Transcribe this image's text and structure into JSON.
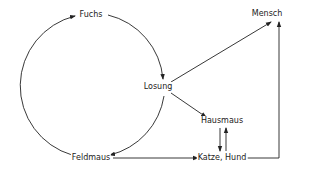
{
  "diagram": {
    "nodes": [
      {
        "id": "fuchs",
        "label": "Fuchs"
      },
      {
        "id": "mensch",
        "label": "Mensch"
      },
      {
        "id": "losung",
        "label": "Losung"
      },
      {
        "id": "hausmaus",
        "label": "Hausmaus"
      },
      {
        "id": "katze_hund",
        "label": "Katze, Hund"
      },
      {
        "id": "feldmaus",
        "label": "Feldmaus"
      }
    ],
    "edges": [
      {
        "from": "feldmaus",
        "to": "fuchs",
        "style": "curved"
      },
      {
        "from": "fuchs",
        "to": "losung",
        "style": "curved"
      },
      {
        "from": "losung",
        "to": "feldmaus",
        "style": "curved"
      },
      {
        "from": "losung",
        "to": "mensch",
        "style": "straight"
      },
      {
        "from": "losung",
        "to": "hausmaus",
        "style": "straight"
      },
      {
        "from": "hausmaus",
        "to": "katze_hund",
        "style": "straight"
      },
      {
        "from": "katze_hund",
        "to": "hausmaus",
        "style": "straight"
      },
      {
        "from": "feldmaus",
        "to": "katze_hund",
        "style": "straight"
      },
      {
        "from": "katze_hund",
        "to": "mensch",
        "style": "elbow"
      }
    ]
  }
}
